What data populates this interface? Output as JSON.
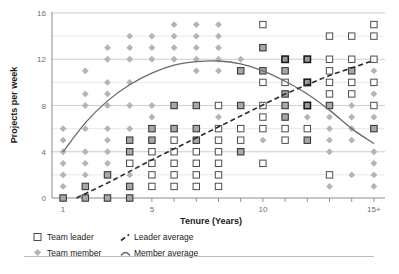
{
  "chart_data": {
    "type": "scatter",
    "title": "",
    "xlabel": "Tenure (Years)",
    "ylabel": "Projects per week",
    "xlim": [
      0.5,
      15.5
    ],
    "ylim": [
      0,
      16
    ],
    "xticks": [
      1,
      5,
      10,
      15
    ],
    "xticklabels": [
      "1",
      "5",
      "10",
      "15+"
    ],
    "yticks": [
      0,
      4,
      8,
      12,
      16
    ],
    "yticklabels": [
      "0",
      "4",
      "8",
      "12",
      "16"
    ],
    "minor_yticks": [
      2,
      6,
      10,
      14
    ],
    "grid": "horizontal",
    "legend_position": "below-axes",
    "series": [
      {
        "name": "Team leader",
        "marker": "open-square",
        "color": "#ffffff",
        "edge_color": "#4d4d4d",
        "points": [
          [
            1,
            0
          ],
          [
            2,
            0
          ],
          [
            3,
            0
          ],
          [
            4,
            0
          ],
          [
            2,
            1
          ],
          [
            3,
            2
          ],
          [
            4,
            1
          ],
          [
            4,
            3
          ],
          [
            4,
            4
          ],
          [
            4,
            5
          ],
          [
            5,
            1
          ],
          [
            5,
            2
          ],
          [
            5,
            3
          ],
          [
            5,
            4
          ],
          [
            5,
            5
          ],
          [
            5,
            6
          ],
          [
            6,
            1
          ],
          [
            6,
            2
          ],
          [
            6,
            3
          ],
          [
            6,
            4
          ],
          [
            6,
            5
          ],
          [
            6,
            6
          ],
          [
            6,
            8
          ],
          [
            7,
            1
          ],
          [
            7,
            2
          ],
          [
            7,
            3
          ],
          [
            7,
            4
          ],
          [
            7,
            5
          ],
          [
            7,
            6
          ],
          [
            7,
            8
          ],
          [
            8,
            1
          ],
          [
            8,
            2
          ],
          [
            8,
            3
          ],
          [
            8,
            4
          ],
          [
            8,
            5
          ],
          [
            8,
            6
          ],
          [
            8,
            8
          ],
          [
            9,
            4
          ],
          [
            9,
            5
          ],
          [
            9,
            6
          ],
          [
            9,
            8
          ],
          [
            9,
            11
          ],
          [
            10,
            3
          ],
          [
            10,
            6
          ],
          [
            10,
            7
          ],
          [
            10,
            8
          ],
          [
            10,
            10
          ],
          [
            10,
            11
          ],
          [
            10,
            13
          ],
          [
            10,
            15
          ],
          [
            11,
            5
          ],
          [
            11,
            6
          ],
          [
            11,
            7
          ],
          [
            11,
            8
          ],
          [
            11,
            9
          ],
          [
            11,
            10
          ],
          [
            11,
            11
          ],
          [
            11,
            12
          ],
          [
            12,
            5
          ],
          [
            12,
            6
          ],
          [
            12,
            8
          ],
          [
            12,
            10
          ],
          [
            12,
            12
          ],
          [
            13,
            2
          ],
          [
            13,
            8
          ],
          [
            13,
            9
          ],
          [
            13,
            10
          ],
          [
            13,
            11
          ],
          [
            13,
            12
          ],
          [
            13,
            14
          ],
          [
            14,
            9
          ],
          [
            14,
            10
          ],
          [
            14,
            11
          ],
          [
            14,
            12
          ],
          [
            14,
            14
          ],
          [
            15,
            6
          ],
          [
            15,
            8
          ],
          [
            15,
            10
          ],
          [
            15,
            12
          ],
          [
            15,
            14
          ],
          [
            15,
            15
          ]
        ]
      },
      {
        "name": "Team member",
        "marker": "diamond",
        "color": "#b4b4b4",
        "points": [
          [
            1,
            0
          ],
          [
            1,
            1
          ],
          [
            1,
            2
          ],
          [
            1,
            3
          ],
          [
            1,
            4
          ],
          [
            1,
            5
          ],
          [
            1,
            6
          ],
          [
            2,
            0
          ],
          [
            2,
            1
          ],
          [
            2,
            2
          ],
          [
            2,
            3
          ],
          [
            2,
            4
          ],
          [
            2,
            6
          ],
          [
            2,
            8
          ],
          [
            2,
            9
          ],
          [
            2,
            11
          ],
          [
            3,
            0
          ],
          [
            3,
            2
          ],
          [
            3,
            3
          ],
          [
            3,
            4
          ],
          [
            3,
            5
          ],
          [
            3,
            6
          ],
          [
            3,
            8
          ],
          [
            3,
            9
          ],
          [
            3,
            10
          ],
          [
            3,
            12
          ],
          [
            3,
            13
          ],
          [
            4,
            0
          ],
          [
            4,
            1
          ],
          [
            4,
            2
          ],
          [
            4,
            4
          ],
          [
            4,
            5
          ],
          [
            4,
            6
          ],
          [
            4,
            8
          ],
          [
            4,
            10
          ],
          [
            4,
            12
          ],
          [
            4,
            13
          ],
          [
            4,
            14
          ],
          [
            5,
            5
          ],
          [
            5,
            6
          ],
          [
            5,
            7
          ],
          [
            5,
            8
          ],
          [
            5,
            12
          ],
          [
            5,
            13
          ],
          [
            5,
            14
          ],
          [
            6,
            6
          ],
          [
            6,
            8
          ],
          [
            6,
            12
          ],
          [
            6,
            13
          ],
          [
            6,
            14
          ],
          [
            6,
            15
          ],
          [
            7,
            5
          ],
          [
            7,
            6
          ],
          [
            7,
            8
          ],
          [
            7,
            11
          ],
          [
            7,
            12
          ],
          [
            7,
            13
          ],
          [
            7,
            14
          ],
          [
            7,
            15
          ],
          [
            8,
            7
          ],
          [
            8,
            11
          ],
          [
            8,
            12
          ],
          [
            8,
            13
          ],
          [
            8,
            14
          ],
          [
            8,
            15
          ],
          [
            9,
            4
          ],
          [
            9,
            8
          ],
          [
            9,
            11
          ],
          [
            9,
            12
          ],
          [
            10,
            5
          ],
          [
            10,
            11
          ],
          [
            10,
            13
          ],
          [
            11,
            7
          ],
          [
            11,
            8
          ],
          [
            11,
            9
          ],
          [
            11,
            11
          ],
          [
            11,
            12
          ],
          [
            12,
            5
          ],
          [
            12,
            7
          ],
          [
            12,
            8
          ],
          [
            12,
            10
          ],
          [
            12,
            12
          ],
          [
            13,
            1
          ],
          [
            13,
            4
          ],
          [
            13,
            5
          ],
          [
            13,
            6
          ],
          [
            13,
            7
          ],
          [
            13,
            8
          ],
          [
            14,
            2
          ],
          [
            14,
            5
          ],
          [
            14,
            6
          ],
          [
            14,
            7
          ],
          [
            14,
            8
          ],
          [
            14,
            11
          ],
          [
            15,
            1
          ],
          [
            15,
            2
          ],
          [
            15,
            3
          ],
          [
            15,
            4
          ],
          [
            15,
            6
          ],
          [
            15,
            7
          ],
          [
            15,
            9
          ],
          [
            15,
            11
          ]
        ]
      }
    ],
    "trendlines": [
      {
        "name": "Leader average",
        "style": "dashed",
        "color": "#2a2a2a",
        "x": [
          1.6,
          3,
          5,
          7,
          9,
          11,
          13,
          15
        ],
        "y": [
          0,
          1.3,
          3.3,
          5.2,
          7.1,
          9.0,
          10.6,
          11.9
        ]
      },
      {
        "name": "Member average",
        "style": "solid-curve",
        "color": "#6a6a6a",
        "x": [
          1,
          2,
          3,
          4,
          5,
          6,
          7,
          8,
          9,
          10,
          11,
          12,
          13,
          14,
          15
        ],
        "y": [
          4.0,
          6.5,
          8.4,
          9.8,
          10.8,
          11.5,
          11.8,
          11.85,
          11.6,
          11.0,
          10.1,
          9.0,
          7.6,
          6.0,
          4.7
        ]
      }
    ]
  },
  "legend": {
    "items": [
      {
        "label": "Team leader",
        "marker": "open-square"
      },
      {
        "label": "Team member",
        "marker": "diamond"
      },
      {
        "label": "Leader average",
        "marker": "dashed-line"
      },
      {
        "label": "Member average",
        "marker": "curve-line"
      }
    ]
  },
  "axes": {
    "x_title": "Tenure (Years)",
    "y_title": "Projects per week",
    "x_tick_labels": [
      "1",
      "5",
      "10",
      "15+"
    ],
    "y_tick_labels": [
      "0",
      "4",
      "8",
      "12",
      "16"
    ]
  }
}
